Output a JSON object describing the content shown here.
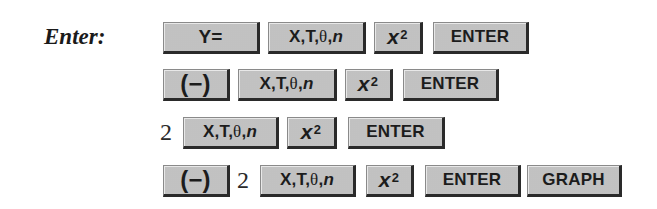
{
  "instruction_label": "Enter:",
  "rows": [
    {
      "items": [
        {
          "type": "key",
          "label": "Y=",
          "name": "y-equals-key"
        },
        {
          "type": "key",
          "label": "X,T,θ,n",
          "name": "xttn-key"
        },
        {
          "type": "key",
          "label": "x²",
          "name": "x-squared-key"
        },
        {
          "type": "key",
          "label": "ENTER",
          "name": "enter-key"
        }
      ]
    },
    {
      "items": [
        {
          "type": "key",
          "label": "(−)",
          "name": "negative-key"
        },
        {
          "type": "key",
          "label": "X,T,θ,n",
          "name": "xttn-key"
        },
        {
          "type": "key",
          "label": "x²",
          "name": "x-squared-key"
        },
        {
          "type": "key",
          "label": "ENTER",
          "name": "enter-key"
        }
      ]
    },
    {
      "items": [
        {
          "type": "number",
          "label": "2"
        },
        {
          "type": "key",
          "label": "X,T,θ,n",
          "name": "xttn-key"
        },
        {
          "type": "key",
          "label": "x²",
          "name": "x-squared-key"
        },
        {
          "type": "key",
          "label": "ENTER",
          "name": "enter-key"
        }
      ]
    },
    {
      "items": [
        {
          "type": "key",
          "label": "(−)",
          "name": "negative-key"
        },
        {
          "type": "number",
          "label": "2"
        },
        {
          "type": "key",
          "label": "X,T,θ,n",
          "name": "xttn-key"
        },
        {
          "type": "key",
          "label": "x²",
          "name": "x-squared-key"
        },
        {
          "type": "key",
          "label": "ENTER",
          "name": "enter-key"
        },
        {
          "type": "key",
          "label": "GRAPH",
          "name": "graph-key"
        }
      ]
    }
  ],
  "key_parts": {
    "y_equals": "Y=",
    "xttn_prefix": "X,T,",
    "theta": "θ",
    "comma": ",",
    "n": "n",
    "x": "x",
    "squared": "2",
    "negative": "(−)",
    "enter": "ENTER",
    "graph": "GRAPH",
    "two": "2"
  }
}
